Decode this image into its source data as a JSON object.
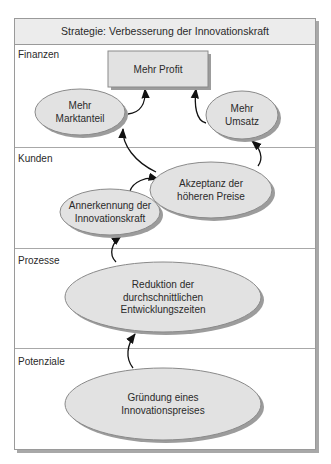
{
  "title": "Strategie: Verbesserung der Innovationskraft",
  "zones": [
    {
      "label": "Finanzen"
    },
    {
      "label": "Kunden"
    },
    {
      "label": "Prozesse"
    },
    {
      "label": "Potenziale"
    }
  ],
  "nodes": {
    "profit": {
      "lines": [
        "Mehr Profit"
      ],
      "shape": "rectangle"
    },
    "marktanteil": {
      "lines": [
        "Mehr",
        "Marktanteil"
      ],
      "shape": "ellipse"
    },
    "umsatz": {
      "lines": [
        "Mehr",
        "Umsatz"
      ],
      "shape": "ellipse"
    },
    "akzeptanz": {
      "lines": [
        "Akzeptanz der",
        "höheren Preise"
      ],
      "shape": "ellipse"
    },
    "annerkennung": {
      "lines": [
        "Annerkennung der",
        "Innovationskraft"
      ],
      "shape": "ellipse"
    },
    "reduktion": {
      "lines": [
        "Reduktion der",
        "durchschnittlichen",
        "Entwicklungszeiten"
      ],
      "shape": "ellipse"
    },
    "gruendung": {
      "lines": [
        "Gründung eines",
        "Innovationspreises"
      ],
      "shape": "ellipse"
    }
  },
  "edges": [
    {
      "from": "marktanteil",
      "to": "profit"
    },
    {
      "from": "umsatz",
      "to": "profit"
    },
    {
      "from": "akzeptanz",
      "to": "marktanteil"
    },
    {
      "from": "akzeptanz",
      "to": "umsatz"
    },
    {
      "from": "annerkennung",
      "to": "akzeptanz"
    },
    {
      "from": "reduktion",
      "to": "annerkennung"
    },
    {
      "from": "gruendung",
      "to": "reduktion"
    }
  ],
  "colors": {
    "node_fill": "#e2e2e2",
    "header_fill": "#ececec",
    "shadow": "#9c9c9c",
    "stroke": "#8a8a8a",
    "arrow": "#111111"
  }
}
